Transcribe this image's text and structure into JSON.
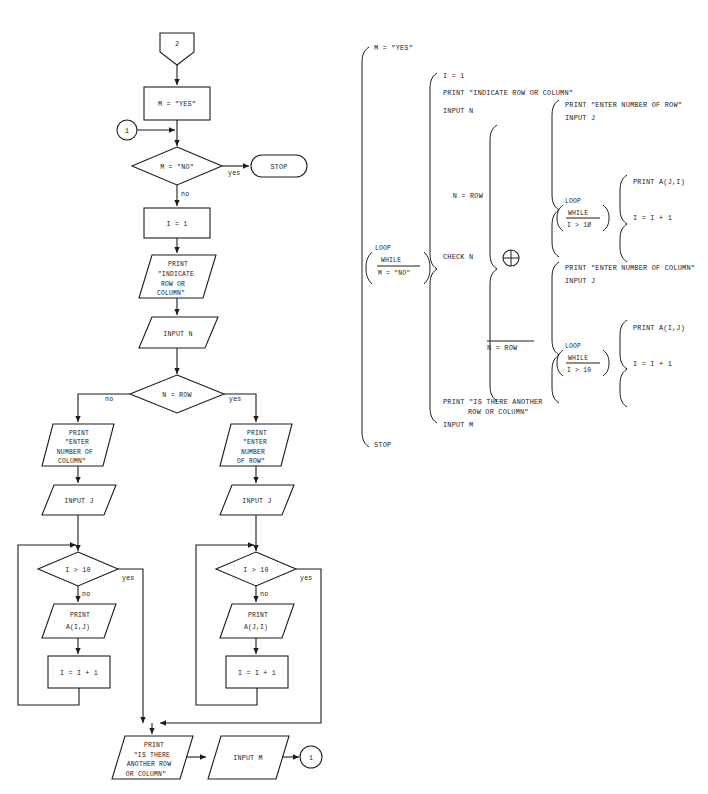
{
  "figure": {
    "type": "flowchart-and-structured-notation"
  },
  "flowchart": {
    "nodes": {
      "entry_connector": "2",
      "set_m_yes": "M = \"YES\"",
      "loop_connector_in": "1",
      "decide_m_no": "M = \"NO\"",
      "stop": "STOP",
      "set_i_1": "I = 1",
      "print_indicate": [
        "PRINT",
        "\"INDICATE",
        "ROW OR",
        "COLUMN\""
      ],
      "input_n": "INPUT N",
      "decide_n_row": "N = ROW",
      "print_enter_col": [
        "PRINT",
        "\"ENTER",
        "NUMBER OF",
        "COLUMN\""
      ],
      "print_enter_row": [
        "PRINT",
        "\"ENTER",
        "NUMBER",
        "OF ROW\""
      ],
      "input_j_left": "INPUT J",
      "input_j_right": "INPUT J",
      "decide_i_gt_10_left": "I > 10",
      "decide_i_gt_10_right": "I > 10",
      "print_aij": [
        "PRINT",
        "A(I,J)"
      ],
      "print_aji": [
        "PRINT",
        "A(J,I)"
      ],
      "incr_i_left": "I = I + 1",
      "incr_i_right": "I = I + 1",
      "print_another": [
        "PRINT",
        "\"IS THERE",
        "ANOTHER ROW",
        "OR COLUMN\""
      ],
      "input_m": "INPUT M",
      "exit_connector": "1"
    },
    "edge_labels": {
      "m_no_yes": "yes",
      "m_no_no": "no",
      "n_row_no": "no",
      "n_row_yes": "yes",
      "i10_left_yes": "yes",
      "i10_left_no": "no",
      "i10_right_yes": "yes",
      "i10_right_no": "no"
    }
  },
  "structured": {
    "level1": {
      "first": "M = \"YES\"",
      "loop_word": "LOOP",
      "loop_while": "WHILE",
      "loop_cond": "M = \"NO\"",
      "loop_cond_overlined": true,
      "last": "STOP"
    },
    "level2": {
      "lines": [
        "I = 1",
        "PRINT \"INDICATE ROW OR COLUMN\"",
        "INPUT N"
      ],
      "check": "CHECK N",
      "tail": [
        "PRINT \"IS THERE ANOTHER",
        "ROW OR COLUMN\"",
        "INPUT M"
      ]
    },
    "level3": {
      "case_true_label": "N = ROW",
      "case_false_label": "N = ROW",
      "case_false_overlined": true,
      "operator_symbol": "⊕",
      "operator_name": "circled-plus"
    },
    "branch_row": {
      "lines": [
        "PRINT \"ENTER NUMBER OF ROW\"",
        "INPUT J"
      ],
      "loop_word": "LOOP",
      "loop_while": "WHILE",
      "loop_cond": "I > 1Ø",
      "body": [
        "PRINT A(J,I)",
        "I = I + 1"
      ]
    },
    "branch_col": {
      "lines": [
        "PRINT \"ENTER NUMBER OF COLUMN\"",
        "INPUT J"
      ],
      "loop_word": "LOOP",
      "loop_while": "WHILE",
      "loop_cond": "I > 10",
      "body": [
        "PRINT A(I,J)",
        "I = I + 1"
      ]
    }
  },
  "colors": {
    "ink": "#1c1c1c",
    "paper": "#ffffff"
  }
}
